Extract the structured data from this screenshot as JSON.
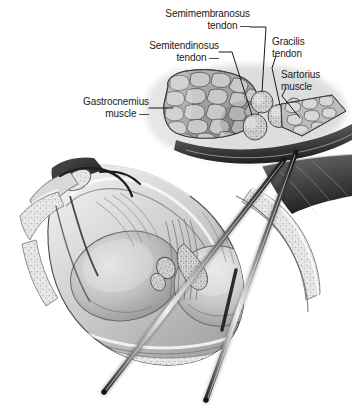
{
  "figure": {
    "background_color": "#ffffff",
    "ink_color": "#1a1a1a",
    "width": 354,
    "height": 415,
    "style": "grayscale medical line-and-wash illustration"
  },
  "labels": [
    {
      "id": "semimembranosus",
      "line1": "Semimembranosus",
      "line2": "tendon —",
      "target": "semimembranosus-tendon-cross-section"
    },
    {
      "id": "semitendinosus",
      "line1": "Semitendinosus",
      "line2": "tendon —",
      "target": "semitendinosus-tendon-cross-section"
    },
    {
      "id": "gracilis",
      "line1": "Gracilis",
      "line2": "tendon",
      "target": "gracilis-tendon-cross-section"
    },
    {
      "id": "sartorius",
      "line1": "Sartorius",
      "line2": "muscle",
      "target": "sartorius-muscle"
    },
    {
      "id": "gastrocnemius",
      "line1": "Gastrocnemius",
      "line2": "muscle —",
      "target": "gastrocnemius-muscle-belly"
    }
  ],
  "structures": [
    {
      "name": "gastrocnemius-muscle-belly",
      "appearance": "cut cross-section with cobblestone fascicle pattern"
    },
    {
      "name": "semitendinosus-tendon-cross-section",
      "appearance": "speckled oval"
    },
    {
      "name": "semimembranosus-tendon-cross-section",
      "appearance": "speckled oval"
    },
    {
      "name": "gracilis-tendon-cross-section",
      "appearance": "speckled oval"
    },
    {
      "name": "sartorius-muscle",
      "appearance": "speckled fan of fascicles"
    },
    {
      "name": "knee-joint-capsule",
      "appearance": "large opened capsule with fibrous striations"
    },
    {
      "name": "medial-femoral-condyle",
      "appearance": "smooth rounded articular surface"
    },
    {
      "name": "lateral-femoral-condyle",
      "appearance": "smooth rounded articular surface"
    },
    {
      "name": "subcutaneous-fat-layer",
      "appearance": "stippled band along inferior margin"
    }
  ],
  "instruments": [
    {
      "name": "surgical-probe-left",
      "orientation": "diagonal, upper-right to lower-left"
    },
    {
      "name": "surgical-probe-right",
      "orientation": "diagonal, upper-right to lower-left"
    }
  ]
}
